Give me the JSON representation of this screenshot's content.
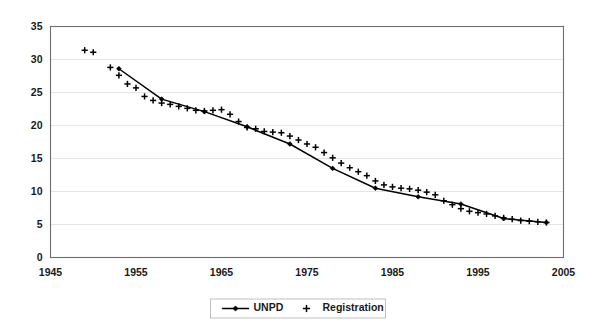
{
  "chart_data": {
    "type": "line",
    "title": "",
    "xlabel": "",
    "ylabel": "",
    "xlim": [
      1945,
      2005
    ],
    "ylim": [
      0,
      35
    ],
    "x_ticks": [
      1945,
      1955,
      1965,
      1975,
      1985,
      1995,
      2005
    ],
    "y_ticks": [
      0,
      5,
      10,
      15,
      20,
      25,
      30,
      35
    ],
    "grid": true,
    "legend_position": "bottom-center",
    "series": [
      {
        "name": "UNPD",
        "marker": "diamond",
        "style": "line-with-markers",
        "color": "#000000",
        "x": [
          1953,
          1958,
          1963,
          1968,
          1973,
          1978,
          1983,
          1988,
          1993,
          1998,
          2003
        ],
        "values": [
          28.6,
          24.0,
          22.1,
          19.8,
          17.2,
          13.5,
          10.5,
          9.2,
          8.1,
          5.9,
          5.3
        ]
      },
      {
        "name": "Registration",
        "marker": "plus",
        "style": "markers-only",
        "color": "#000000",
        "x": [
          1949,
          1950,
          1952,
          1953,
          1954,
          1955,
          1956,
          1957,
          1958,
          1959,
          1960,
          1961,
          1962,
          1963,
          1964,
          1965,
          1966,
          1967,
          1968,
          1969,
          1970,
          1971,
          1972,
          1973,
          1974,
          1975,
          1976,
          1977,
          1978,
          1979,
          1980,
          1981,
          1982,
          1983,
          1984,
          1985,
          1986,
          1987,
          1988,
          1989,
          1990,
          1991,
          1992,
          1993,
          1994,
          1995,
          1996,
          1997,
          1998,
          1999,
          2000,
          2001,
          2002,
          2003
        ],
        "values": [
          31.4,
          31.1,
          28.8,
          27.6,
          26.3,
          25.7,
          24.4,
          23.8,
          23.4,
          23.2,
          22.9,
          22.6,
          22.3,
          22.2,
          22.3,
          22.4,
          21.7,
          20.6,
          19.7,
          19.5,
          19.1,
          19.0,
          18.9,
          18.4,
          17.8,
          17.2,
          16.7,
          15.9,
          15.1,
          14.3,
          13.6,
          13.0,
          12.4,
          11.6,
          11.0,
          10.7,
          10.5,
          10.4,
          10.2,
          9.9,
          9.5,
          8.6,
          8.0,
          7.4,
          7.0,
          6.8,
          6.6,
          6.3,
          6.0,
          5.8,
          5.6,
          5.5,
          5.4,
          5.3
        ]
      }
    ]
  },
  "legend": {
    "items": [
      {
        "label": "UNPD",
        "marker": "diamond-line"
      },
      {
        "label": "Registration",
        "marker": "plus"
      }
    ]
  },
  "axis": {
    "y_labels": [
      "35",
      "30",
      "25",
      "20",
      "15",
      "10",
      "5",
      "0"
    ],
    "x_labels": [
      "1945",
      "1955",
      "1965",
      "1975",
      "1985",
      "1995",
      "2005"
    ]
  }
}
